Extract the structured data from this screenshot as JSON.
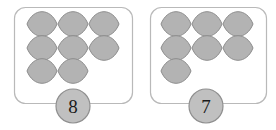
{
  "canvas": {
    "width": 276,
    "height": 130,
    "background": "#ffffff"
  },
  "style": {
    "box_stroke": "#b9b9b9",
    "box_fill": "#ffffff",
    "token_fill": "#b3b3b3",
    "token_stroke": "#8c8c8c",
    "badge_fill": "#c0c0c0",
    "badge_stroke": "#8f8f8f",
    "label_color": "#1a1a1a"
  },
  "groups": [
    {
      "id": "group-left",
      "count_label": "8",
      "token_count": 8,
      "token_shape": "lens",
      "box": {
        "x": 14,
        "y": 7,
        "width": 118,
        "height": 96,
        "radius": 11
      },
      "badge": {
        "cx": 73,
        "cy": 106,
        "r": 17
      },
      "rows": [
        {
          "y": 24,
          "xs": [
            42,
            73,
            104
          ]
        },
        {
          "y": 48,
          "xs": [
            42,
            73,
            104
          ]
        },
        {
          "y": 71,
          "xs": [
            42,
            73
          ]
        }
      ]
    },
    {
      "id": "group-right",
      "count_label": "7",
      "token_count": 7,
      "token_shape": "lens",
      "box": {
        "x": 150,
        "y": 7,
        "width": 116,
        "height": 96,
        "radius": 11
      },
      "badge": {
        "cx": 206,
        "cy": 106,
        "r": 17
      },
      "rows": [
        {
          "y": 24,
          "xs": [
            176,
            207,
            238
          ]
        },
        {
          "y": 48,
          "xs": [
            176,
            207,
            238
          ]
        },
        {
          "y": 71,
          "xs": [
            176
          ]
        }
      ]
    }
  ],
  "token_geometry": {
    "half_width": 15,
    "half_height": 8
  }
}
